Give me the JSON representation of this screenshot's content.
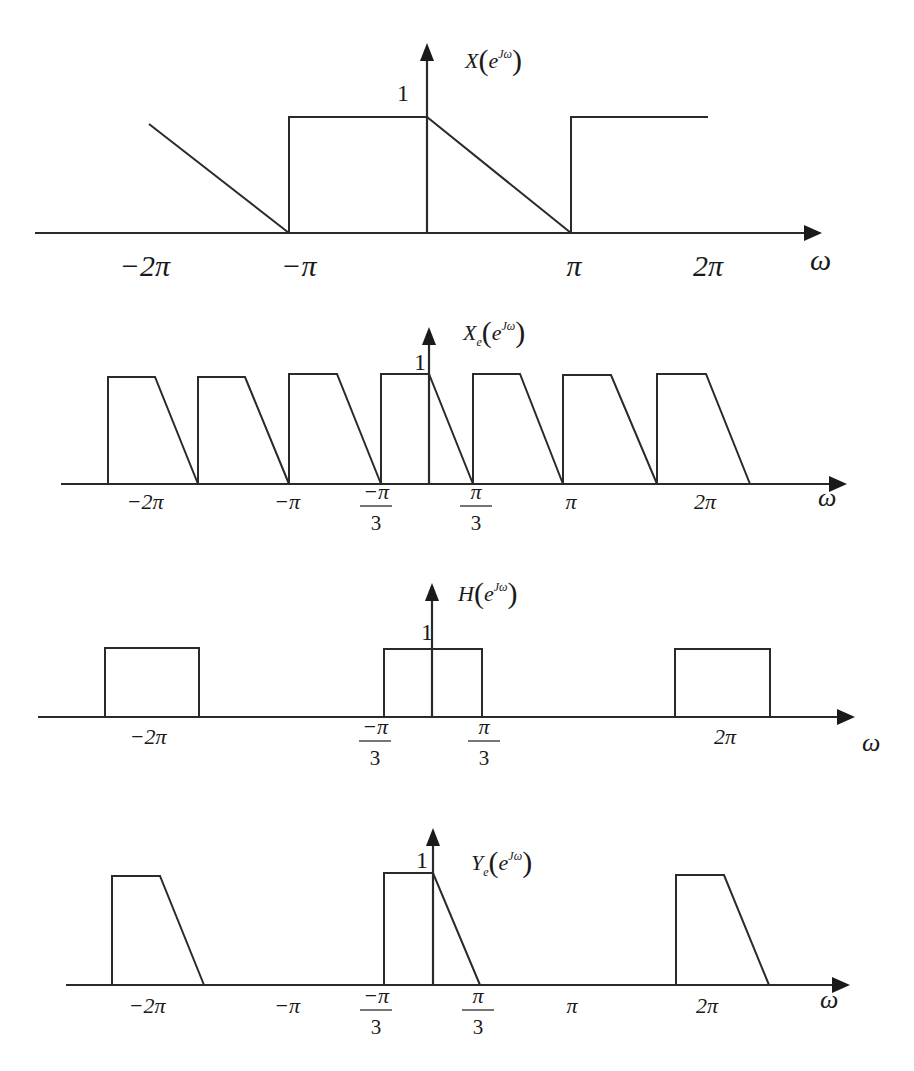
{
  "chart_data": [
    {
      "type": "line",
      "title": "X(e^{jω})",
      "function_label": {
        "main": "X",
        "sub": "",
        "arg": "e",
        "sup": "Jω"
      },
      "xlabel": "ω",
      "ylabel_value": "1",
      "layout": {
        "axis_y": 233,
        "axis_x0": 35,
        "axis_x1": 822,
        "origin_x": 427,
        "yaxis_top": 43,
        "level1_y": 117,
        "label_x": 465,
        "label_y": 68,
        "one_x": 397,
        "one_y": 101,
        "omega_x": 810,
        "omega_y": 262,
        "tick_y": 262
      },
      "x_ticks": [
        {
          "label": "−2π",
          "x": 145,
          "frac": false
        },
        {
          "label": "−π",
          "x": 299,
          "frac": false
        },
        {
          "label": "π",
          "x": 574,
          "frac": false
        },
        {
          "label": "2π",
          "x": 708,
          "frac": false
        }
      ],
      "segments": [
        {
          "kind": "polyline",
          "points": [
            [
              149,
              124
            ],
            [
              289,
              233
            ]
          ]
        },
        {
          "kind": "polyline",
          "points": [
            [
              289,
              233
            ],
            [
              289,
              117
            ],
            [
              427,
              117
            ],
            [
              571,
              233
            ]
          ]
        },
        {
          "kind": "polyline",
          "points": [
            [
              571,
              233
            ],
            [
              571,
              117
            ],
            [
              708,
              117
            ]
          ]
        }
      ],
      "description": "Spectrum over (-2π, 2π): linear ramp down reaching 0 at -π; 1 on (-π,0); ramp from 1 at 0 down to 0 at π; 1 on (π,2π).",
      "x_units": "rad",
      "y_range": [
        0,
        1
      ]
    },
    {
      "type": "line",
      "title": "X_e(e^{jω})",
      "function_label": {
        "main": "X",
        "sub": "e",
        "arg": "e",
        "sup": "Jω"
      },
      "xlabel": "ω",
      "ylabel_value": "1",
      "layout": {
        "axis_y": 484,
        "axis_x0": 61,
        "axis_x1": 847,
        "origin_x": 429,
        "yaxis_top": 327,
        "level1_y": 376,
        "label_x": 463,
        "label_y": 340,
        "one_x": 414,
        "one_y": 370,
        "omega_x": 818,
        "omega_y": 506,
        "tick_y": 503
      },
      "x_ticks": [
        {
          "label": "−2π",
          "x": 145,
          "frac": false
        },
        {
          "label": "−π",
          "x": 287,
          "frac": false
        },
        {
          "num": "−π",
          "den": "3",
          "x": 376,
          "frac": true
        },
        {
          "num": "π",
          "den": "3",
          "x": 476,
          "frac": true
        },
        {
          "label": "π",
          "x": 571,
          "frac": false
        },
        {
          "label": "2π",
          "x": 705,
          "frac": false
        }
      ],
      "segments": [
        {
          "kind": "polyline",
          "points": [
            [
              108,
              484
            ],
            [
              108,
              377
            ],
            [
              155,
              377
            ],
            [
              198,
              484
            ]
          ]
        },
        {
          "kind": "polyline",
          "points": [
            [
              198,
              484
            ],
            [
              198,
              377
            ],
            [
              245,
              377
            ],
            [
              289,
              484
            ]
          ]
        },
        {
          "kind": "polyline",
          "points": [
            [
              289,
              484
            ],
            [
              289,
              374
            ],
            [
              337,
              374
            ],
            [
              381,
              484
            ]
          ]
        },
        {
          "kind": "polyline",
          "points": [
            [
              381,
              484
            ],
            [
              381,
              374
            ],
            [
              429,
              374
            ],
            [
              473,
              484
            ]
          ]
        },
        {
          "kind": "polyline",
          "points": [
            [
              473,
              484
            ],
            [
              473,
              374
            ],
            [
              520,
              374
            ],
            [
              563,
              484
            ]
          ]
        },
        {
          "kind": "polyline",
          "points": [
            [
              563,
              484
            ],
            [
              563,
              375
            ],
            [
              611,
              375
            ],
            [
              657,
              484
            ]
          ]
        },
        {
          "kind": "polyline",
          "points": [
            [
              657,
              484
            ],
            [
              657,
              374
            ],
            [
              706,
              374
            ],
            [
              750,
              484
            ]
          ]
        }
      ],
      "description": "Expanded spectrum: 7 repeated trapezoids (rise at left edge, flat top of height 1, linear fall) with period 2π/3.",
      "y_range": [
        0,
        1
      ]
    },
    {
      "type": "line",
      "title": "H(e^{jω})",
      "function_label": {
        "main": "H",
        "sub": "",
        "arg": "e",
        "sup": "Jω"
      },
      "xlabel": "ω",
      "ylabel_value": "1",
      "layout": {
        "axis_y": 717,
        "axis_x0": 38,
        "axis_x1": 855,
        "origin_x": 432,
        "yaxis_top": 583,
        "level1_y": 649,
        "label_x": 458,
        "label_y": 601,
        "one_x": 421,
        "one_y": 640,
        "omega_x": 862,
        "omega_y": 751,
        "tick_y": 738
      },
      "x_ticks": [
        {
          "label": "−2π",
          "x": 148,
          "frac": false
        },
        {
          "num": "−π",
          "den": "3",
          "x": 375,
          "frac": true
        },
        {
          "num": "π",
          "den": "3",
          "x": 484,
          "frac": true
        },
        {
          "label": "2π",
          "x": 725,
          "frac": false
        }
      ],
      "segments": [
        {
          "kind": "polyline",
          "points": [
            [
              105,
              717
            ],
            [
              105,
              648
            ],
            [
              199,
              648
            ],
            [
              199,
              717
            ]
          ]
        },
        {
          "kind": "polyline",
          "points": [
            [
              384,
              717
            ],
            [
              384,
              649
            ],
            [
              482,
              649
            ],
            [
              482,
              717
            ]
          ]
        },
        {
          "kind": "polyline",
          "points": [
            [
              675,
              717
            ],
            [
              675,
              649
            ],
            [
              770,
              649
            ],
            [
              770,
              717
            ]
          ]
        }
      ],
      "description": "Ideal lowpass filter: magnitude 1 on |ω| < π/3, periodic with period 2π (passbands centered at -2π, 0, 2π).",
      "y_range": [
        0,
        1
      ]
    },
    {
      "type": "line",
      "title": "Y_e(e^{jω})",
      "function_label": {
        "main": "Y",
        "sub": "e",
        "arg": "e",
        "sup": "Jω"
      },
      "xlabel": "ω",
      "ylabel_value": "1",
      "layout": {
        "axis_y": 985,
        "axis_x0": 66,
        "axis_x1": 850,
        "origin_x": 433,
        "yaxis_top": 828,
        "level1_y": 874,
        "label_x": 471,
        "label_y": 870,
        "one_x": 416,
        "one_y": 868,
        "omega_x": 820,
        "omega_y": 1008,
        "tick_y": 1007
      },
      "x_ticks": [
        {
          "label": "−2π",
          "x": 147,
          "frac": false
        },
        {
          "label": "−π",
          "x": 287,
          "frac": false
        },
        {
          "num": "−π",
          "den": "3",
          "x": 376,
          "frac": true
        },
        {
          "num": "π",
          "den": "3",
          "x": 478,
          "frac": true
        },
        {
          "label": "π",
          "x": 572,
          "frac": false
        },
        {
          "label": "2π",
          "x": 707,
          "frac": false
        }
      ],
      "segments": [
        {
          "kind": "polyline",
          "points": [
            [
              112,
              985
            ],
            [
              112,
              876
            ],
            [
              160,
              876
            ],
            [
              204,
              985
            ]
          ]
        },
        {
          "kind": "polyline",
          "points": [
            [
              384,
              985
            ],
            [
              384,
              873
            ],
            [
              433,
              873
            ],
            [
              480,
              985
            ]
          ]
        },
        {
          "kind": "polyline",
          "points": [
            [
              676,
              985
            ],
            [
              676,
              875
            ],
            [
              724,
              875
            ],
            [
              769,
              985
            ]
          ]
        }
      ],
      "description": "Filtered output: only the trapezoid centered at each multiple of 2π (from -π/3 to π/3) survives.",
      "y_range": [
        0,
        1
      ]
    }
  ]
}
